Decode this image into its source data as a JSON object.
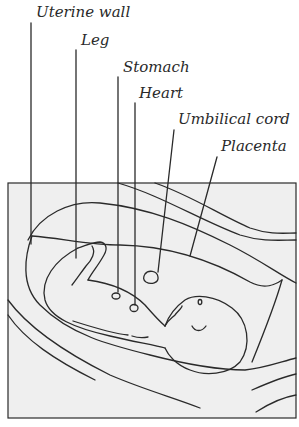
{
  "diagram": {
    "type": "labeled anatomical illustration",
    "labels": [
      {
        "id": "uterine-wall",
        "text": "Uterine wall"
      },
      {
        "id": "leg",
        "text": "Leg"
      },
      {
        "id": "stomach",
        "text": "Stomach"
      },
      {
        "id": "heart",
        "text": "Heart"
      },
      {
        "id": "umbilical-cord",
        "text": "Umbilical cord"
      },
      {
        "id": "placenta",
        "text": "Placenta"
      }
    ],
    "colors": {
      "line": "#2a2a2a",
      "box_fill": "#efefef",
      "background": "#ffffff"
    }
  }
}
